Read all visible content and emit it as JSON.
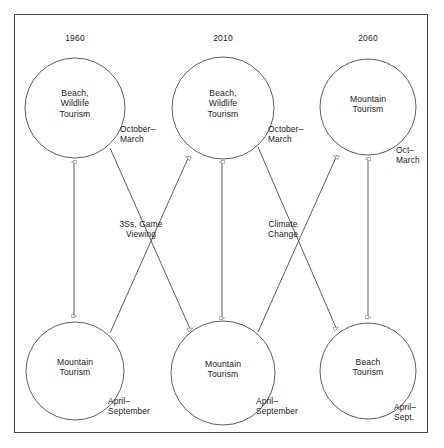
{
  "figure": {
    "type": "diagram",
    "border_color": "#4a4a4a",
    "line_color": "#555555",
    "text_color": "#1a1a1a"
  },
  "eras": [
    {
      "id": "era-1960",
      "label": "1960",
      "x": 75
    },
    {
      "id": "era-2010",
      "label": "2010",
      "x": 223
    },
    {
      "id": "era-2060",
      "label": "2060",
      "x": 368
    }
  ],
  "nodes": [
    {
      "id": "top-1960",
      "label": "Beach,\nWildlife\nTourism",
      "cx": 75,
      "cy": 108,
      "r": 50
    },
    {
      "id": "top-2010",
      "label": "Beach,\nWildlife\nTourism",
      "cx": 223,
      "cy": 108,
      "r": 51
    },
    {
      "id": "top-2060",
      "label": "Mountain\nTourism",
      "cx": 368,
      "cy": 107,
      "r": 48
    },
    {
      "id": "bottom-1960",
      "label": "Mountain\nTourism",
      "cx": 75,
      "cy": 371,
      "r": 49
    },
    {
      "id": "bottom-2010",
      "label": "Mountain\nTourism",
      "cx": 223,
      "cy": 373,
      "r": 52
    },
    {
      "id": "bottom-2060",
      "label": "Beach\nTourism",
      "cx": 368,
      "cy": 371,
      "r": 48
    }
  ],
  "season_labels": [
    {
      "id": "season-top-1960",
      "label": "October–\nMarch",
      "x": 120,
      "y": 124
    },
    {
      "id": "season-top-2010",
      "label": "October–\nMarch",
      "x": 268,
      "y": 124
    },
    {
      "id": "season-top-2060",
      "label": "Oct–\nMarch",
      "x": 396,
      "y": 145
    },
    {
      "id": "season-bottom-1960",
      "label": "April–\nSeptember",
      "x": 108,
      "y": 396
    },
    {
      "id": "season-bottom-2010",
      "label": "April–\nSeptember",
      "x": 256,
      "y": 396
    },
    {
      "id": "season-bottom-2060",
      "label": "April–\nSept.",
      "x": 394,
      "y": 402
    }
  ],
  "driver_labels": [
    {
      "id": "driver-3ss-game-viewing",
      "label": "3Ss,   Game\nViewing",
      "x": 117,
      "y": 219
    },
    {
      "id": "driver-climate-change",
      "label": "Climate\nChange",
      "x": 270,
      "y": 219
    }
  ]
}
